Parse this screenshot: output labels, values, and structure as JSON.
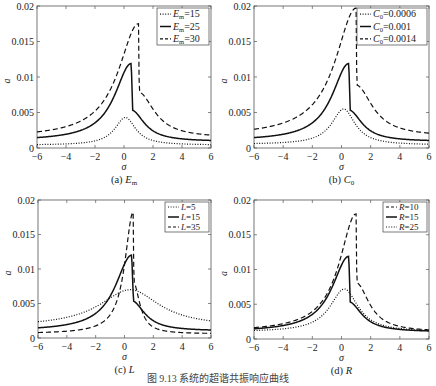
{
  "figure_caption": "图 9.13   系统的超谐共振响应曲线",
  "chart_data": [
    {
      "type": "line",
      "id": "a",
      "subtitle": "(a)  E_m",
      "subtitle_label": "(a)",
      "subtitle_var": "E",
      "subtitle_sub": "m",
      "xlabel": "σ",
      "ylabel": "a",
      "xlim": [
        -6,
        6
      ],
      "ylim": [
        0,
        0.02
      ],
      "xticks": [
        -6,
        -4,
        -2,
        0,
        2,
        4,
        6
      ],
      "yticks": [
        0,
        0.005,
        0.01,
        0.015,
        0.02
      ],
      "ytick_labels": [
        "0",
        "0.005",
        "0.01",
        "0.015",
        "0.02"
      ],
      "grid": false,
      "legend_position": "upper right",
      "box": {
        "x": 37,
        "y": 6,
        "w": 174,
        "h": 142
      },
      "series": [
        {
          "name": "E_m=15",
          "var": "E",
          "sub": "m",
          "val": "=15",
          "style": "dotted",
          "peak_x": 0.1,
          "peak_y": 0.0043,
          "tail_left": 0.0004,
          "tail_right": 0.0004,
          "width": 0.9,
          "jump_x": null
        },
        {
          "name": "E_m=25",
          "var": "E",
          "sub": "m",
          "val": "=25",
          "style": "solid",
          "peak_x": 0.5,
          "peak_y": 0.0119,
          "tail_left": 0.001,
          "tail_right": 0.0009,
          "width": 1.2,
          "jump_x": 0.6
        },
        {
          "name": "E_m=30",
          "var": "E",
          "sub": "m",
          "val": "=30",
          "style": "dashed",
          "peak_x": 1.0,
          "peak_y": 0.0175,
          "tail_left": 0.0014,
          "tail_right": 0.0014,
          "width": 1.45,
          "jump_x": 1.05
        }
      ]
    },
    {
      "type": "line",
      "id": "b",
      "subtitle": "(b)  C_0",
      "subtitle_label": "(b)",
      "subtitle_var": "C",
      "subtitle_sub": "0",
      "xlabel": "σ",
      "ylabel": "a",
      "xlim": [
        -6,
        6
      ],
      "ylim": [
        0,
        0.02
      ],
      "xticks": [
        -6,
        -4,
        -2,
        0,
        2,
        4,
        6
      ],
      "yticks": [
        0,
        0.005,
        0.01,
        0.015,
        0.02
      ],
      "ytick_labels": [
        "0",
        "0.005",
        "0.01",
        "0.015",
        "0.02"
      ],
      "grid": false,
      "legend_position": "upper right",
      "box": {
        "x": 254,
        "y": 6,
        "w": 175,
        "h": 142
      },
      "series": [
        {
          "name": "C_0=0.0006",
          "var": "C",
          "sub": "0",
          "val": "=0.0006",
          "style": "dotted",
          "peak_x": 0.15,
          "peak_y": 0.0055,
          "tail_left": 0.0005,
          "tail_right": 0.0004,
          "width": 1.0,
          "jump_x": null
        },
        {
          "name": "C_0=0.001",
          "var": "C",
          "sub": "0",
          "val": "=0.001",
          "style": "solid",
          "peak_x": 0.5,
          "peak_y": 0.0119,
          "tail_left": 0.001,
          "tail_right": 0.0009,
          "width": 1.2,
          "jump_x": 0.6
        },
        {
          "name": "C_0=0.0014",
          "var": "C",
          "sub": "0",
          "val": "=0.0014",
          "style": "dashed",
          "peak_x": 1.0,
          "peak_y": 0.0197,
          "tail_left": 0.0016,
          "tail_right": 0.0016,
          "width": 1.5,
          "jump_x": 1.05
        }
      ]
    },
    {
      "type": "line",
      "id": "c",
      "subtitle": "(c)  L",
      "subtitle_label": "(c)",
      "subtitle_var": "L",
      "subtitle_sub": "",
      "xlabel": "σ",
      "ylabel": "a",
      "xlim": [
        -6,
        6
      ],
      "ylim": [
        0,
        0.02
      ],
      "xticks": [
        -6,
        -4,
        -2,
        0,
        2,
        4,
        6
      ],
      "yticks": [
        0,
        0.005,
        0.01,
        0.015,
        0.02
      ],
      "ytick_labels": [
        "0",
        "0.005",
        "0.01",
        "0.015",
        "0.02"
      ],
      "grid": false,
      "legend_position": "upper right",
      "box": {
        "x": 38,
        "y": 200,
        "w": 173,
        "h": 138
      },
      "series": [
        {
          "name": "L=5",
          "var": "L",
          "sub": "",
          "val": "=5",
          "style": "dotted",
          "peak_x": 0.4,
          "peak_y": 0.007,
          "tail_left": 0.0016,
          "tail_right": 0.0016,
          "width": 2.6,
          "jump_x": null
        },
        {
          "name": "L=15",
          "var": "L",
          "sub": "",
          "val": "=15",
          "style": "solid",
          "peak_x": 0.5,
          "peak_y": 0.012,
          "tail_left": 0.001,
          "tail_right": 0.001,
          "width": 1.2,
          "jump_x": 0.62
        },
        {
          "name": "L=35",
          "var": "L",
          "sub": "",
          "val": "=35",
          "style": "dashed",
          "peak_x": 0.6,
          "peak_y": 0.0182,
          "tail_left": 0.0006,
          "tail_right": 0.0006,
          "width": 0.6,
          "jump_x": 0.65
        }
      ]
    },
    {
      "type": "line",
      "id": "d",
      "subtitle": "(d)  R",
      "subtitle_label": "(d)",
      "subtitle_var": "R",
      "subtitle_sub": "",
      "xlabel": "σ",
      "ylabel": "a",
      "xlim": [
        -6,
        6
      ],
      "ylim": [
        0,
        0.02
      ],
      "xticks": [
        -6,
        -4,
        -2,
        0,
        2,
        4,
        6
      ],
      "yticks": [
        0,
        0.005,
        0.01,
        0.015,
        0.02
      ],
      "ytick_labels": [
        "0",
        "0.005",
        "0.01",
        "0.015",
        "0.02"
      ],
      "grid": false,
      "legend_position": "upper right",
      "box": {
        "x": 254,
        "y": 200,
        "w": 175,
        "h": 139
      },
      "series": [
        {
          "name": "R=10",
          "var": "R",
          "sub": "",
          "val": "=10",
          "style": "dashed",
          "peak_x": 1.0,
          "peak_y": 0.018,
          "tail_left": 0.001,
          "tail_right": 0.001,
          "width": 1.2,
          "jump_x": 1.05,
          "shape": "R"
        },
        {
          "name": "R=15",
          "var": "R",
          "sub": "",
          "val": "=15",
          "style": "solid",
          "peak_x": 0.5,
          "peak_y": 0.0119,
          "tail_left": 0.001,
          "tail_right": 0.001,
          "width": 1.2,
          "jump_x": 0.6,
          "shape": "R"
        },
        {
          "name": "R=25",
          "var": "R",
          "sub": "",
          "val": "=25",
          "style": "dotted",
          "peak_x": 0.2,
          "peak_y": 0.0072,
          "tail_left": 0.001,
          "tail_right": 0.001,
          "width": 1.2,
          "jump_x": null,
          "shape": "R"
        }
      ]
    }
  ]
}
